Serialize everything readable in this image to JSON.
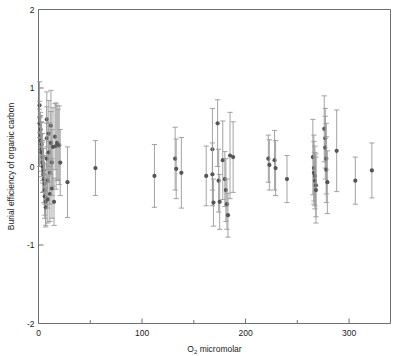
{
  "chart_data": {
    "type": "scatter",
    "title": "",
    "xlabel": "O2 micromolar",
    "xlabel_base": "O",
    "xlabel_sub": "2",
    "xlabel_rest": " micromolar",
    "ylabel": "Burial efficiency of organic carbon",
    "xlim": [
      0,
      340
    ],
    "ylim": [
      -2,
      2
    ],
    "xticks": [
      0,
      100,
      200,
      300
    ],
    "xticklabels": [
      "0",
      "100",
      "200",
      "300"
    ],
    "xminorticks": [
      50,
      150,
      250
    ],
    "yticks": [
      -2,
      -1,
      0,
      1,
      2
    ],
    "yticklabels": [
      "-2",
      "-1",
      "0",
      "1",
      "2"
    ],
    "grid": false,
    "legend": false,
    "marker": "filled-circle",
    "marker_color": "#555555",
    "errorbar_color": "#999999",
    "frame_color": "#707070",
    "errorbars": "vertical",
    "series": [
      {
        "name": "Burial efficiency vs oxygen",
        "points": [
          {
            "x": 1,
            "y": 0.78,
            "yerr_low": 0.78,
            "yerr_high": 0.3
          },
          {
            "x": 1,
            "y": 0.63,
            "yerr_low": 0.2,
            "yerr_high": 0.2
          },
          {
            "x": 1,
            "y": 0.55,
            "yerr_low": 0.18,
            "yerr_high": 0.18
          },
          {
            "x": 2,
            "y": 0.47,
            "yerr_low": 0.22,
            "yerr_high": 0.22
          },
          {
            "x": 2,
            "y": 0.4,
            "yerr_low": 0.25,
            "yerr_high": 0.25
          },
          {
            "x": 2,
            "y": 0.33,
            "yerr_low": 0.3,
            "yerr_high": 0.3
          },
          {
            "x": 3,
            "y": 0.28,
            "yerr_low": 0.28,
            "yerr_high": 0.28
          },
          {
            "x": 3,
            "y": 0.22,
            "yerr_low": 0.35,
            "yerr_high": 0.35
          },
          {
            "x": 3,
            "y": 0.18,
            "yerr_low": 0.24,
            "yerr_high": 0.24
          },
          {
            "x": 4,
            "y": 0.12,
            "yerr_low": 0.3,
            "yerr_high": 0.3
          },
          {
            "x": 4,
            "y": 0.05,
            "yerr_low": 0.26,
            "yerr_high": 0.26
          },
          {
            "x": 4,
            "y": 0.0,
            "yerr_low": 0.33,
            "yerr_high": 0.33
          },
          {
            "x": 5,
            "y": -0.05,
            "yerr_low": 0.28,
            "yerr_high": 0.28
          },
          {
            "x": 5,
            "y": -0.1,
            "yerr_low": 0.22,
            "yerr_high": 0.22
          },
          {
            "x": 5,
            "y": -0.16,
            "yerr_low": 0.3,
            "yerr_high": 0.3
          },
          {
            "x": 6,
            "y": -0.22,
            "yerr_low": 0.26,
            "yerr_high": 0.26
          },
          {
            "x": 6,
            "y": -0.3,
            "yerr_low": 0.32,
            "yerr_high": 0.32
          },
          {
            "x": 6,
            "y": -0.38,
            "yerr_low": 0.28,
            "yerr_high": 0.28
          },
          {
            "x": 7,
            "y": -0.45,
            "yerr_low": 0.3,
            "yerr_high": 0.3
          },
          {
            "x": 7,
            "y": -0.52,
            "yerr_low": 0.25,
            "yerr_high": 0.25
          },
          {
            "x": 8,
            "y": 0.6,
            "yerr_low": 0.35,
            "yerr_high": 0.35
          },
          {
            "x": 8,
            "y": 0.36,
            "yerr_low": 0.4,
            "yerr_high": 0.4
          },
          {
            "x": 8,
            "y": 0.1,
            "yerr_low": 0.45,
            "yerr_high": 0.45
          },
          {
            "x": 9,
            "y": -0.18,
            "yerr_low": 0.35,
            "yerr_high": 0.35
          },
          {
            "x": 9,
            "y": -0.42,
            "yerr_low": 0.3,
            "yerr_high": 0.3
          },
          {
            "x": 10,
            "y": 0.42,
            "yerr_low": 0.42,
            "yerr_high": 0.42
          },
          {
            "x": 10,
            "y": 0.18,
            "yerr_low": 0.38,
            "yerr_high": 0.38
          },
          {
            "x": 11,
            "y": -0.08,
            "yerr_low": 0.4,
            "yerr_high": 0.4
          },
          {
            "x": 11,
            "y": -0.35,
            "yerr_low": 0.35,
            "yerr_high": 0.35
          },
          {
            "x": 12,
            "y": 0.52,
            "yerr_low": 0.45,
            "yerr_high": 0.45
          },
          {
            "x": 12,
            "y": 0.3,
            "yerr_low": 0.4,
            "yerr_high": 0.4
          },
          {
            "x": 13,
            "y": 0.05,
            "yerr_low": 0.42,
            "yerr_high": 0.42
          },
          {
            "x": 13,
            "y": -0.28,
            "yerr_low": 0.38,
            "yerr_high": 0.38
          },
          {
            "x": 14,
            "y": 0.25,
            "yerr_low": 0.5,
            "yerr_high": 0.5
          },
          {
            "x": 15,
            "y": -0.45,
            "yerr_low": 0.3,
            "yerr_high": 0.3
          },
          {
            "x": 16,
            "y": 0.38,
            "yerr_low": 0.42,
            "yerr_high": 0.42
          },
          {
            "x": 17,
            "y": 0.26,
            "yerr_low": 0.55,
            "yerr_high": 0.55
          },
          {
            "x": 18,
            "y": 0.3,
            "yerr_low": 0.48,
            "yerr_high": 0.48
          },
          {
            "x": 19,
            "y": 0.28,
            "yerr_low": 0.45,
            "yerr_high": 0.45
          },
          {
            "x": 20,
            "y": 0.27,
            "yerr_low": 0.5,
            "yerr_high": 0.5
          },
          {
            "x": 21,
            "y": 0.05,
            "yerr_low": 0.42,
            "yerr_high": 0.42
          },
          {
            "x": 28,
            "y": -0.2,
            "yerr_low": 0.45,
            "yerr_high": 0.45
          },
          {
            "x": 55,
            "y": -0.02,
            "yerr_low": 0.35,
            "yerr_high": 0.35
          },
          {
            "x": 112,
            "y": -0.12,
            "yerr_low": 0.4,
            "yerr_high": 0.4
          },
          {
            "x": 132,
            "y": 0.1,
            "yerr_low": 0.4,
            "yerr_high": 0.4
          },
          {
            "x": 133,
            "y": -0.03,
            "yerr_low": 0.38,
            "yerr_high": 0.38
          },
          {
            "x": 138,
            "y": -0.08,
            "yerr_low": 0.45,
            "yerr_high": 0.45
          },
          {
            "x": 162,
            "y": -0.12,
            "yerr_low": 0.38,
            "yerr_high": 0.38
          },
          {
            "x": 168,
            "y": 0.22,
            "yerr_low": 0.52,
            "yerr_high": 0.52
          },
          {
            "x": 168,
            "y": -0.1,
            "yerr_low": 0.4,
            "yerr_high": 0.4
          },
          {
            "x": 169,
            "y": -0.46,
            "yerr_low": 0.3,
            "yerr_high": 0.3
          },
          {
            "x": 173,
            "y": 0.55,
            "yerr_low": 0.55,
            "yerr_high": 0.3
          },
          {
            "x": 174,
            "y": -0.18,
            "yerr_low": 0.4,
            "yerr_high": 0.4
          },
          {
            "x": 175,
            "y": -0.45,
            "yerr_low": 0.35,
            "yerr_high": 0.35
          },
          {
            "x": 178,
            "y": 0.08,
            "yerr_low": 0.5,
            "yerr_high": 0.5
          },
          {
            "x": 180,
            "y": -0.16,
            "yerr_low": 0.35,
            "yerr_high": 0.35
          },
          {
            "x": 181,
            "y": -0.3,
            "yerr_low": 0.4,
            "yerr_high": 0.4
          },
          {
            "x": 182,
            "y": -0.48,
            "yerr_low": 0.32,
            "yerr_high": 0.32
          },
          {
            "x": 183,
            "y": -0.62,
            "yerr_low": 0.28,
            "yerr_high": 0.28
          },
          {
            "x": 185,
            "y": 0.14,
            "yerr_low": 0.55,
            "yerr_high": 0.55
          },
          {
            "x": 188,
            "y": 0.12,
            "yerr_low": 0.45,
            "yerr_high": 0.45
          },
          {
            "x": 222,
            "y": 0.1,
            "yerr_low": 0.3,
            "yerr_high": 0.3
          },
          {
            "x": 223,
            "y": 0.02,
            "yerr_low": 0.32,
            "yerr_high": 0.32
          },
          {
            "x": 228,
            "y": 0.08,
            "yerr_low": 0.38,
            "yerr_high": 0.38
          },
          {
            "x": 229,
            "y": -0.02,
            "yerr_low": 0.35,
            "yerr_high": 0.35
          },
          {
            "x": 240,
            "y": -0.16,
            "yerr_low": 0.3,
            "yerr_high": 0.3
          },
          {
            "x": 265,
            "y": 0.12,
            "yerr_low": 0.48,
            "yerr_high": 0.48
          },
          {
            "x": 266,
            "y": -0.02,
            "yerr_low": 0.42,
            "yerr_high": 0.42
          },
          {
            "x": 266,
            "y": -0.08,
            "yerr_low": 0.4,
            "yerr_high": 0.4
          },
          {
            "x": 267,
            "y": -0.12,
            "yerr_low": 0.38,
            "yerr_high": 0.38
          },
          {
            "x": 267,
            "y": -0.18,
            "yerr_low": 0.36,
            "yerr_high": 0.36
          },
          {
            "x": 268,
            "y": -0.24,
            "yerr_low": 0.4,
            "yerr_high": 0.4
          },
          {
            "x": 268,
            "y": -0.3,
            "yerr_low": 0.42,
            "yerr_high": 0.42
          },
          {
            "x": 276,
            "y": 0.48,
            "yerr_low": 0.42,
            "yerr_high": 0.42
          },
          {
            "x": 277,
            "y": 0.36,
            "yerr_low": 0.38,
            "yerr_high": 0.38
          },
          {
            "x": 277,
            "y": 0.24,
            "yerr_low": 0.4,
            "yerr_high": 0.4
          },
          {
            "x": 278,
            "y": 0.1,
            "yerr_low": 0.45,
            "yerr_high": 0.45
          },
          {
            "x": 278,
            "y": -0.04,
            "yerr_low": 0.42,
            "yerr_high": 0.42
          },
          {
            "x": 279,
            "y": -0.2,
            "yerr_low": 0.4,
            "yerr_high": 0.4
          },
          {
            "x": 288,
            "y": 0.2,
            "yerr_low": 0.52,
            "yerr_high": 0.52
          },
          {
            "x": 306,
            "y": -0.18,
            "yerr_low": 0.3,
            "yerr_high": 0.3
          },
          {
            "x": 322,
            "y": -0.05,
            "yerr_low": 0.35,
            "yerr_high": 0.35
          }
        ]
      }
    ]
  }
}
